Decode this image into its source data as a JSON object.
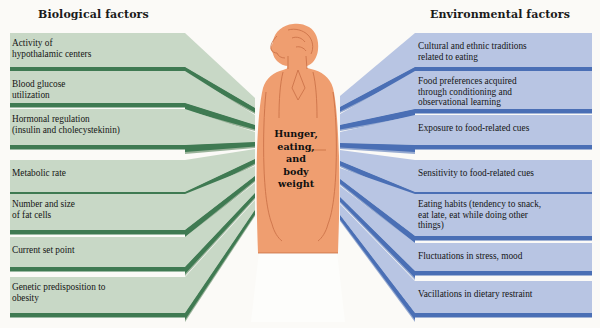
{
  "diagram": {
    "background_color": "#fbfaf7"
  },
  "columns": {
    "left": {
      "header": "Biological factors",
      "panel_color": "#c8d8c6",
      "edge_color": "#3f7a52",
      "shadow_color": "#93ae94"
    },
    "right": {
      "header": "Environmental factors",
      "panel_color": "#b8c5e3",
      "edge_color": "#4a6fb5",
      "shadow_color": "#8fa4ce"
    }
  },
  "center": {
    "label": "Hunger,\neating,\nand\nbody\nweight",
    "figure_name": "woman-silhouette",
    "skin_color": "#ef9e70",
    "outline_color": "#c76a42",
    "skirt_color": "#fdfdfb"
  },
  "biological_factors": [
    {
      "id": 1,
      "label": "Activity of\nhypothalamic centers"
    },
    {
      "id": 2,
      "label": "Blood glucose\nutilization"
    },
    {
      "id": 3,
      "label": "Hormonal regulation\n(insulin and cholecystekinin)"
    },
    {
      "id": 4,
      "label": "Metabolic rate"
    },
    {
      "id": 5,
      "label": "Number and size\nof fat cells"
    },
    {
      "id": 6,
      "label": "Current set point"
    },
    {
      "id": 7,
      "label": "Genetic predisposition to\nobesity"
    }
  ],
  "environmental_factors": [
    {
      "id": 1,
      "label": "Cultural and ethnic traditions\nrelated to eating"
    },
    {
      "id": 2,
      "label": "Food preferences acquired\nthrough conditioning and\nobservational learning"
    },
    {
      "id": 3,
      "label": "Exposure to food-related cues"
    },
    {
      "id": 4,
      "label": "Sensitivity to food-related cues"
    },
    {
      "id": 5,
      "label": "Eating habits (tendency to snack,\neat late, eat while doing other\nthings)"
    },
    {
      "id": 6,
      "label": "Fluctuations in stress, mood"
    },
    {
      "id": 7,
      "label": "Vacillations in dietary restraint"
    }
  ]
}
